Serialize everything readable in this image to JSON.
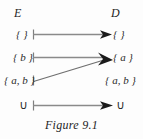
{
  "figure": {
    "caption": "Figure 9.1",
    "columns": {
      "left_heading": "E",
      "right_heading": "D"
    },
    "colors": {
      "background": "#fdfdfd",
      "text": "#2a2a2a",
      "line": "#8a8a8a",
      "arrowhead": "#1a1a1a"
    },
    "left_nodes": [
      {
        "label": "{ }"
      },
      {
        "label": "{ b }"
      },
      {
        "label": "{ a, b }"
      },
      {
        "label": "∪"
      }
    ],
    "right_nodes": [
      {
        "label": "{ }"
      },
      {
        "label": "{ a }"
      },
      {
        "label": "{ a, b }"
      },
      {
        "label": "∪"
      }
    ],
    "edges": [
      {
        "from": "{ }",
        "to": "{ }",
        "kind": "horizontal"
      },
      {
        "from": "{ b }",
        "to": "{ a }",
        "kind": "horizontal"
      },
      {
        "from": "{ a, b }",
        "to": "{ a }",
        "kind": "diagonal"
      },
      {
        "from": "∪",
        "to": "∪",
        "kind": "horizontal"
      }
    ]
  }
}
